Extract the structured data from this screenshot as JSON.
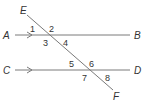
{
  "diagram": {
    "type": "parallel-lines-transversal",
    "points": {
      "A": "A",
      "B": "B",
      "C": "C",
      "D": "D",
      "E": "E",
      "F": "F"
    },
    "angles": [
      "1",
      "2",
      "3",
      "4",
      "5",
      "6",
      "7",
      "8"
    ],
    "line_color": "#7a7a7a",
    "text_color": "#333333"
  }
}
